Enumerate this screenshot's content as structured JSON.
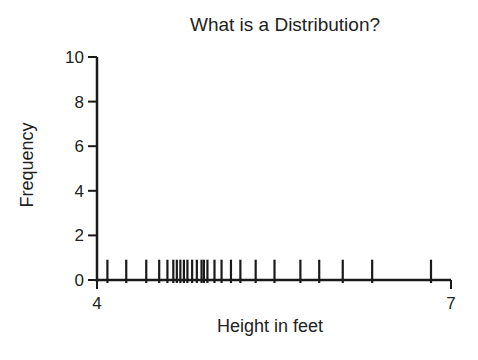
{
  "chart_data": {
    "type": "bar",
    "subtype": "rug/spike plot",
    "title": "What is a Distribution?",
    "xlabel": "Height in feet",
    "ylabel": "Frequency",
    "xlim": [
      4,
      7
    ],
    "ylim": [
      0,
      10
    ],
    "x_ticks": [
      4,
      7
    ],
    "y_ticks": [
      0,
      2,
      4,
      6,
      8,
      10
    ],
    "grid": false,
    "legend": null,
    "x": [
      4.08,
      4.24,
      4.41,
      4.52,
      4.59,
      4.64,
      4.67,
      4.7,
      4.73,
      4.76,
      4.8,
      4.84,
      4.88,
      4.9,
      4.93,
      4.99,
      5.05,
      5.13,
      5.21,
      5.34,
      5.5,
      5.72,
      5.88,
      6.08,
      6.33,
      6.83
    ],
    "values": [
      1,
      1,
      1,
      1,
      1,
      1,
      1,
      1,
      1,
      1,
      1,
      1,
      1,
      1,
      1,
      1,
      1,
      1,
      1,
      1,
      1,
      1,
      1,
      1,
      1,
      1
    ]
  },
  "title": "What is a Distribution?",
  "axes": {
    "xlabel": "Height in feet",
    "ylabel": "Frequency",
    "x_tick_labels": [
      "4",
      "7"
    ],
    "y_tick_labels": [
      "0",
      "2",
      "4",
      "6",
      "8",
      "10"
    ]
  },
  "colors": {
    "ink": "#1a1a1a",
    "background": "#ffffff"
  }
}
